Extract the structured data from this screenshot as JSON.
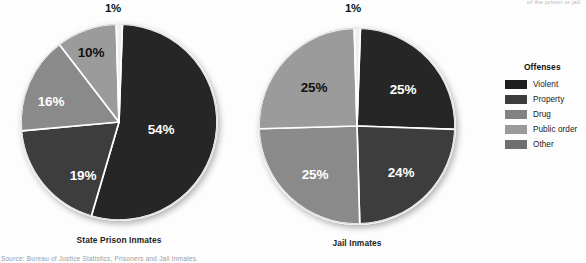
{
  "page": {
    "background": "#fdfdfd",
    "top_cropped_text": "of the prison or jail.",
    "bottom_cropped_text": "Source: Bureau of Justice Statistics, Prisoners and Jail Inmates."
  },
  "legend": {
    "title": "Offenses",
    "items": [
      {
        "label": "Violent",
        "color": "#1f1f1f"
      },
      {
        "label": "Property",
        "color": "#3d3d3d"
      },
      {
        "label": "Drug",
        "color": "#828282"
      },
      {
        "label": "Public order",
        "color": "#9a9a9a"
      },
      {
        "label": "Other",
        "color": "#6f6f6f"
      }
    ]
  },
  "chart_data": [
    {
      "type": "pie",
      "title": "State Prison Inmates",
      "name": "state-prison-inmates",
      "center": {
        "x": 119,
        "y": 122
      },
      "radius": 98,
      "start_angle": -88,
      "categories": [
        "Violent",
        "Property",
        "Drug",
        "Public order",
        "Other"
      ],
      "values": [
        54,
        19,
        16,
        10,
        1
      ],
      "labels": [
        "54%",
        "19%",
        "16%",
        "10%",
        "1%"
      ],
      "colors": [
        "#262626",
        "#3d3d3d",
        "#8a8a8a",
        "#9b9b9b",
        "#efefef"
      ],
      "label_colors": [
        "light",
        "light",
        "light",
        "dark",
        "dark"
      ],
      "label_positions": [
        {
          "x": 161,
          "y": 129,
          "mode": "inside"
        },
        {
          "x": 83,
          "y": 175,
          "mode": "inside"
        },
        {
          "x": 51,
          "y": 101,
          "mode": "inside"
        },
        {
          "x": 91,
          "y": 52,
          "mode": "inside"
        },
        {
          "x": 113,
          "y": 2,
          "mode": "callout"
        }
      ]
    },
    {
      "type": "pie",
      "title": "Jail Inmates",
      "name": "jail-inmates",
      "center": {
        "x": 357,
        "y": 126
      },
      "radius": 98,
      "start_angle": -88,
      "categories": [
        "Violent",
        "Property",
        "Drug",
        "Public order",
        "Other"
      ],
      "values": [
        25,
        24,
        25,
        25,
        1
      ],
      "labels": [
        "25%",
        "24%",
        "25%",
        "25%",
        "1%"
      ],
      "colors": [
        "#262626",
        "#3d3d3d",
        "#8a8a8a",
        "#9b9b9b",
        "#efefef"
      ],
      "label_colors": [
        "light",
        "light",
        "light",
        "dark",
        "dark"
      ],
      "label_positions": [
        {
          "x": 403,
          "y": 89,
          "mode": "inside"
        },
        {
          "x": 401,
          "y": 172,
          "mode": "inside"
        },
        {
          "x": 315,
          "y": 174,
          "mode": "inside"
        },
        {
          "x": 314,
          "y": 87,
          "mode": "inside"
        },
        {
          "x": 353,
          "y": 2,
          "mode": "callout"
        }
      ]
    }
  ],
  "titles": {
    "state_prison": {
      "text": "State Prison Inmates",
      "x": 119,
      "y": 235
    },
    "jail": {
      "text": "Jail Inmates",
      "x": 357,
      "y": 238
    }
  }
}
